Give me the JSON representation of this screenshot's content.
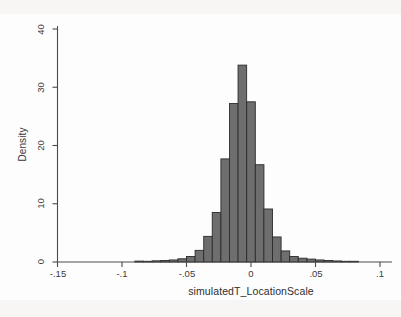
{
  "chart_data": {
    "type": "bar",
    "title": "",
    "xlabel": "simulatedT_LocationScale",
    "ylabel": "Density",
    "xlim": [
      -0.165,
      0.112
    ],
    "ylim": [
      0,
      41
    ],
    "grid": false,
    "legend": false,
    "xticks": [
      -0.15,
      -0.1,
      -0.05,
      0,
      0.05,
      0.1
    ],
    "xtick_labels": [
      "-.15",
      "-.1",
      "-.05",
      "0",
      ".05",
      ".1"
    ],
    "yticks": [
      0,
      10,
      20,
      30,
      40
    ],
    "ytick_labels": [
      "0",
      "10",
      "20",
      "30",
      "40"
    ],
    "bar_width": 0.00667,
    "bar_color": "#6e6e6e",
    "bar_edge_color": "#2b2b2b",
    "categories": [
      -0.0867,
      -0.08,
      -0.0733,
      -0.0667,
      -0.06,
      -0.0533,
      -0.0467,
      -0.04,
      -0.0333,
      -0.0267,
      -0.02,
      -0.0133,
      -0.0067,
      0.0,
      0.0067,
      0.0133,
      0.02,
      0.0267,
      0.0333,
      0.04,
      0.0467,
      0.0533,
      0.06,
      0.0667,
      0.0733,
      0.08
    ],
    "values": [
      0.15,
      0.1,
      0.2,
      0.25,
      0.35,
      0.55,
      0.95,
      2.0,
      4.4,
      8.5,
      17.7,
      27.2,
      33.8,
      27.5,
      16.7,
      9.1,
      4.3,
      1.9,
      0.95,
      0.65,
      0.5,
      0.35,
      0.25,
      0.18,
      0.12,
      0.08
    ]
  },
  "figure": {
    "y_axis_title": "Density",
    "x_axis_title": "simulatedT_LocationScale"
  }
}
